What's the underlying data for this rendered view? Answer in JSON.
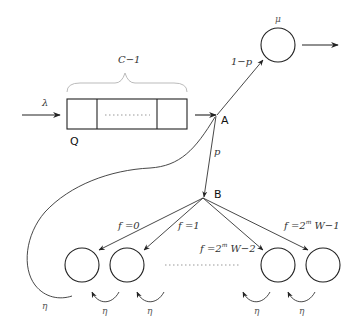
{
  "diagram": {
    "arrival_rate_label": "λ",
    "queue": {
      "label": "Q",
      "capacity_label": "C−1",
      "cells": 3
    },
    "nodes": {
      "junction_a": "A",
      "junction_b": "B"
    },
    "server": {
      "rate_label": "μ"
    },
    "edges": {
      "to_server_prob": "1−p",
      "to_backoff_prob": "p"
    },
    "backoff_stages": [
      {
        "prefix": "f =",
        "value": "0",
        "sup": "",
        "suffix": ""
      },
      {
        "prefix": "f =",
        "value": "1",
        "sup": "",
        "suffix": ""
      },
      {
        "prefix": "f =",
        "value": "2",
        "sup": "m",
        "suffix": " W−2"
      },
      {
        "prefix": "f =",
        "value": "2",
        "sup": "m",
        "suffix": " W−1"
      }
    ],
    "retry_rate_label": "η",
    "loop_labels": [
      "η",
      "η",
      "η",
      "η",
      "η"
    ]
  }
}
